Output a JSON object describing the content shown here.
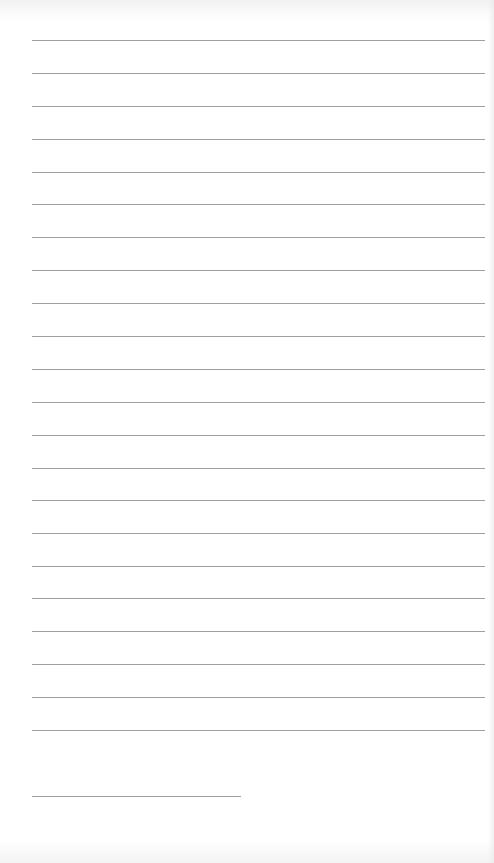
{
  "document": {
    "type": "lined-paper",
    "colors": {
      "background": "#ffffff",
      "rule": "#a0a0a0"
    },
    "rules": {
      "left": 32,
      "right": 485,
      "y_positions": [
        40,
        73,
        106,
        139,
        172,
        204,
        237,
        270,
        303,
        336,
        369,
        402,
        435,
        468,
        500,
        533,
        566,
        598,
        631,
        664,
        697,
        730
      ]
    },
    "signature_line": {
      "left": 32,
      "right": 241,
      "y": 796
    }
  }
}
